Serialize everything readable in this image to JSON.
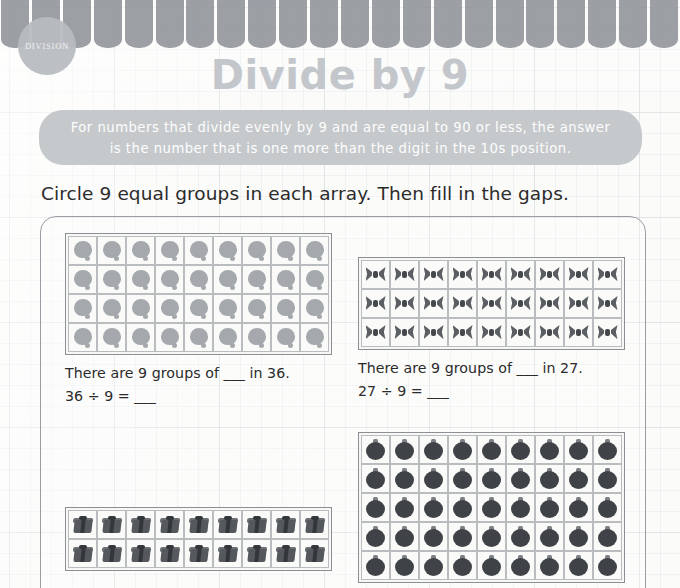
{
  "banner": {
    "badge_label": "DIVISION",
    "stripe_count": 22,
    "stripe_color": "#8e9297",
    "badge_color": "#b8bcc0"
  },
  "header": {
    "title": "Divide by 9",
    "title_color": "#c3c7cb"
  },
  "tip": {
    "line1": "For numbers that divide evenly by 9 and are equal to 90 or less, the answer",
    "line2": "is the number that is one more than the digit in the 10s position.",
    "box_color": "#c6c9cc"
  },
  "instruction": {
    "text": "Circle 9 equal groups in each array. Then fill in the gaps."
  },
  "problems": [
    {
      "id": "problem-1",
      "icon": "balloon-icon",
      "columns": 9,
      "rows": 4,
      "total": 36,
      "divisor": 9,
      "sentence": "There are 9 groups of ___ in 36.",
      "equation": "36 ÷ 9 = ___",
      "cell_size": 29
    },
    {
      "id": "problem-2",
      "icon": "bow-icon",
      "columns": 9,
      "rows": 3,
      "total": 27,
      "divisor": 9,
      "sentence": "There are 9 groups of ___ in 27.",
      "equation": "27 ÷ 9 = ___",
      "cell_size": 29
    },
    {
      "id": "problem-3",
      "icon": "ornament-ball-icon",
      "columns": 9,
      "rows": 5,
      "total": 45,
      "divisor": 9,
      "sentence": "",
      "equation": "",
      "cell_size": 29
    },
    {
      "id": "problem-4",
      "icon": "gift-box-icon",
      "columns": 9,
      "rows": 2,
      "total": 18,
      "divisor": 9,
      "sentence": "",
      "equation": "",
      "cell_size": 29
    }
  ]
}
